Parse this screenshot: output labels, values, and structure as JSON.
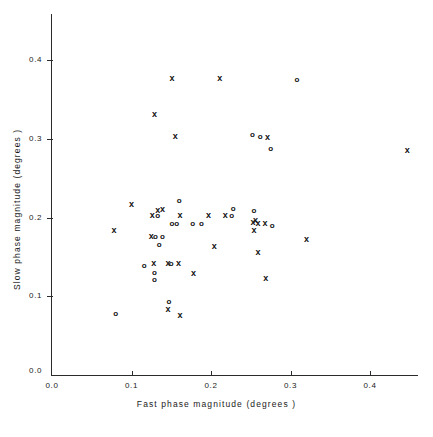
{
  "chart_data": {
    "type": "scatter",
    "title": "",
    "xlabel": "Fast phase magnitude  (degrees )",
    "ylabel": "Slow phase magnitude  (degrees )",
    "xlim": [
      0.0,
      0.458
    ],
    "ylim": [
      0.0,
      0.442
    ],
    "grid": false,
    "legend": "none",
    "xticks": [
      0.0,
      0.1,
      0.2,
      0.3,
      0.4
    ],
    "xtick_labels": [
      "0.0",
      "0.1",
      "0.2",
      "0.3",
      "0.4"
    ],
    "yticks": [
      0.0,
      0.1,
      0.2,
      0.3,
      0.4
    ],
    "ytick_labels": [
      "0.0",
      "0.1",
      "0.2",
      "0.3",
      "0.4"
    ],
    "origin_label": "0.0",
    "series": [
      {
        "name": "x-marker",
        "marker": "x",
        "points": [
          [
            0.151,
            0.376
          ],
          [
            0.211,
            0.376
          ],
          [
            0.129,
            0.331
          ],
          [
            0.155,
            0.303
          ],
          [
            0.271,
            0.301
          ],
          [
            0.447,
            0.285
          ],
          [
            0.1,
            0.216
          ],
          [
            0.133,
            0.209
          ],
          [
            0.139,
            0.21
          ],
          [
            0.126,
            0.203
          ],
          [
            0.161,
            0.202
          ],
          [
            0.197,
            0.203
          ],
          [
            0.218,
            0.203
          ],
          [
            0.256,
            0.196
          ],
          [
            0.253,
            0.194
          ],
          [
            0.259,
            0.193
          ],
          [
            0.268,
            0.192
          ],
          [
            0.078,
            0.184
          ],
          [
            0.254,
            0.184
          ],
          [
            0.125,
            0.176
          ],
          [
            0.32,
            0.172
          ],
          [
            0.204,
            0.163
          ],
          [
            0.259,
            0.155
          ],
          [
            0.128,
            0.141
          ],
          [
            0.146,
            0.141
          ],
          [
            0.159,
            0.141
          ],
          [
            0.178,
            0.129
          ],
          [
            0.269,
            0.122
          ],
          [
            0.146,
            0.083
          ],
          [
            0.161,
            0.075
          ]
        ]
      },
      {
        "name": "o-marker",
        "marker": "o",
        "points": [
          [
            0.308,
            0.375
          ],
          [
            0.252,
            0.305
          ],
          [
            0.262,
            0.303
          ],
          [
            0.275,
            0.288
          ],
          [
            0.16,
            0.221
          ],
          [
            0.133,
            0.203
          ],
          [
            0.226,
            0.203
          ],
          [
            0.228,
            0.212
          ],
          [
            0.254,
            0.209
          ],
          [
            0.151,
            0.193
          ],
          [
            0.157,
            0.193
          ],
          [
            0.177,
            0.193
          ],
          [
            0.188,
            0.193
          ],
          [
            0.277,
            0.19
          ],
          [
            0.13,
            0.176
          ],
          [
            0.139,
            0.176
          ],
          [
            0.135,
            0.166
          ],
          [
            0.116,
            0.139
          ],
          [
            0.15,
            0.141
          ],
          [
            0.129,
            0.13
          ],
          [
            0.129,
            0.121
          ],
          [
            0.147,
            0.093
          ],
          [
            0.08,
            0.078
          ]
        ]
      }
    ]
  }
}
